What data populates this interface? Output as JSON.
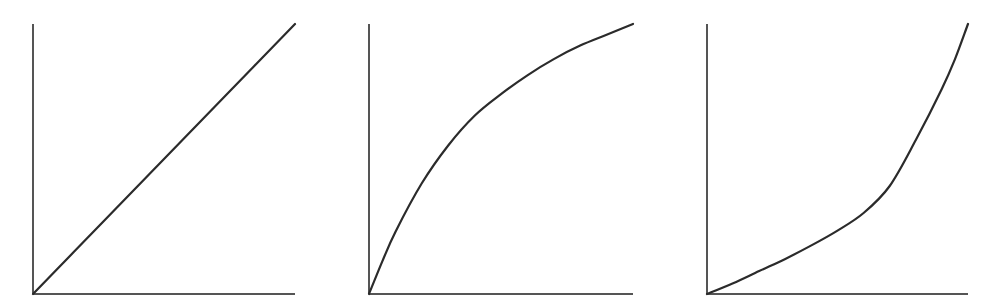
{
  "colors": {
    "background": "#ffffff",
    "axis": "#555555",
    "curve": "#2b2b2b"
  },
  "chart_data": [
    {
      "type": "line",
      "name": "linear",
      "title": "",
      "xlabel": "",
      "ylabel": "",
      "grid": false,
      "legend": null,
      "xlim": [
        0,
        1
      ],
      "ylim": [
        0,
        1
      ],
      "frame": {
        "x0": 33,
        "x1": 295,
        "y0": 294,
        "y1": 24
      },
      "x": [
        0,
        0.25,
        0.5,
        0.75,
        1.0
      ],
      "y": [
        0,
        0.25,
        0.5,
        0.75,
        1.0
      ]
    },
    {
      "type": "line",
      "name": "concave-saturating",
      "title": "",
      "xlabel": "",
      "ylabel": "",
      "grid": false,
      "legend": null,
      "xlim": [
        0,
        1
      ],
      "ylim": [
        0,
        1
      ],
      "frame": {
        "x0": 369,
        "x1": 633,
        "y0": 294,
        "y1": 24
      },
      "x": [
        0,
        0.05,
        0.1,
        0.2,
        0.3,
        0.4,
        0.5,
        0.6,
        0.7,
        0.8,
        0.9,
        1.0
      ],
      "y": [
        0,
        0.12,
        0.23,
        0.41,
        0.55,
        0.66,
        0.74,
        0.81,
        0.87,
        0.92,
        0.96,
        1.0
      ]
    },
    {
      "type": "line",
      "name": "convex-exponential",
      "title": "",
      "xlabel": "",
      "ylabel": "",
      "grid": false,
      "legend": null,
      "xlim": [
        0,
        1
      ],
      "ylim": [
        0,
        1
      ],
      "frame": {
        "x0": 707,
        "x1": 968,
        "y0": 294,
        "y1": 24
      },
      "x": [
        0,
        0.1,
        0.2,
        0.3,
        0.4,
        0.5,
        0.6,
        0.7,
        0.8,
        0.9,
        0.95,
        1.0
      ],
      "y": [
        0,
        0.04,
        0.085,
        0.13,
        0.18,
        0.235,
        0.3,
        0.4,
        0.57,
        0.76,
        0.87,
        1.0
      ]
    }
  ]
}
